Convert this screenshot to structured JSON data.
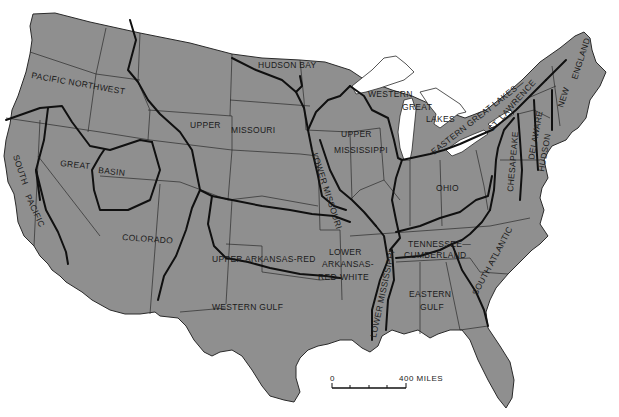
{
  "map": {
    "title": "Water Resource Regions of the Conterminous United States",
    "land_color": "#8f8f8f",
    "water_color": "#ffffff",
    "boundary_color": "#101010",
    "regions": [
      {
        "id": "pacific-northwest",
        "label": "PACIFIC NORTHWEST"
      },
      {
        "id": "hudson-bay",
        "label": "HUDSON BAY"
      },
      {
        "id": "upper-missouri",
        "label_line1": "UPPER",
        "label_line2": "MISSOURI"
      },
      {
        "id": "western-great-lakes",
        "label_line1": "WESTERN",
        "label_line2": "GREAT",
        "label_line3": "LAKES"
      },
      {
        "id": "eastern-great-lakes",
        "label": "EASTERN GREAT LAKES—"
      },
      {
        "id": "st-lawrence",
        "label": "ST. LAWRENCE"
      },
      {
        "id": "new-england",
        "label_line1": "NEW",
        "label_line2": "ENGLAND"
      },
      {
        "id": "upper-mississippi",
        "label_line1": "UPPER",
        "label_line2": "MISSISSIPPI"
      },
      {
        "id": "lower-missouri",
        "label": "LOWER MISSOURI"
      },
      {
        "id": "great-basin",
        "label_line1": "GREAT",
        "label_line2": "BASIN"
      },
      {
        "id": "south-pacific",
        "label_line1": "SOUTH",
        "label_line2": "PACIFIC"
      },
      {
        "id": "colorado",
        "label": "COLORADO"
      },
      {
        "id": "upper-arkansas-red",
        "label": "UPPER ARKANSAS-RED"
      },
      {
        "id": "lower-arkansas-red-white",
        "label_line1": "LOWER",
        "label_line2": "ARKANSAS-",
        "label_line3": "RED-WHITE"
      },
      {
        "id": "western-gulf",
        "label": "WESTERN GULF"
      },
      {
        "id": "lower-mississippi",
        "label": "LOWER MISSISSIPPI"
      },
      {
        "id": "tennessee-cumberland",
        "label_line1": "TENNESSEE—",
        "label_line2": "CUMBERLAND"
      },
      {
        "id": "ohio",
        "label": "OHIO"
      },
      {
        "id": "eastern-gulf",
        "label_line1": "EASTERN",
        "label_line2": "GULF"
      },
      {
        "id": "south-atlantic",
        "label": "SOUTH ATLANTIC"
      },
      {
        "id": "chesapeake",
        "label": "CHESAPEAKE"
      },
      {
        "id": "delaware-hudson",
        "label_line1": "DELAWARE",
        "label_line2": "HUDSON"
      }
    ],
    "scale_bar": {
      "start_label": "0",
      "end_label": "400 MILES",
      "ticks": 5
    }
  }
}
